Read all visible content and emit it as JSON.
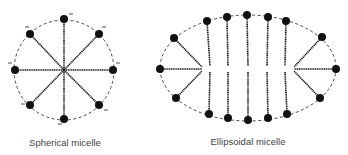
{
  "diagrams": [
    {
      "id": "spherical",
      "caption": "Spherical micelle",
      "charge_label": "−"
    },
    {
      "id": "ellipsoidal",
      "caption": "Ellipsoidal micelle"
    }
  ],
  "colors": {
    "ink": "#111111",
    "caption": "#444444",
    "background": "#ffffff"
  }
}
